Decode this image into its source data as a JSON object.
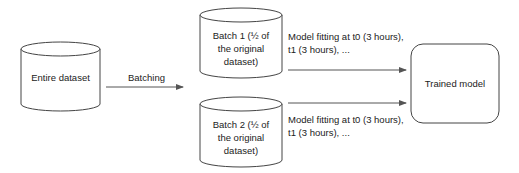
{
  "nodes": {
    "entire_dataset": {
      "label": "Entire dataset"
    },
    "batch1": {
      "line1": "Batch 1 (½ of",
      "line2": "the original",
      "line3": "dataset)"
    },
    "batch2": {
      "line1": "Batch 2 (½ of",
      "line2": "the original",
      "line3": "dataset)"
    },
    "trained_model": {
      "label": "Trained model"
    }
  },
  "edges": {
    "batching": {
      "label": "Batching"
    },
    "fit1": {
      "line1": "Model fitting at t0 (3 hours),",
      "line2": "t1 (3 hours), ..."
    },
    "fit2": {
      "line1": "Model fitting at t0 (3 hours),",
      "line2": "t1 (3 hours), ..."
    }
  },
  "colors": {
    "stroke": "#444444",
    "arrow": "#555555",
    "text": "#222222"
  }
}
